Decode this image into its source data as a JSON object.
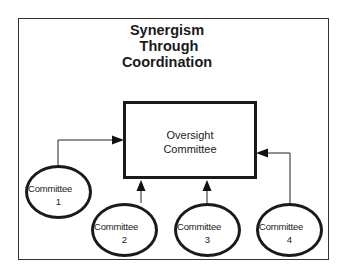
{
  "diagram": {
    "title_lines": [
      "Synergism",
      "Through",
      "Coordination"
    ],
    "center": {
      "line1": "Oversight",
      "line2": "Committee"
    },
    "committees": [
      {
        "label": "Committee",
        "number": "1"
      },
      {
        "label": "Committee",
        "number": "2"
      },
      {
        "label": "Committee",
        "number": "3"
      },
      {
        "label": "Committee",
        "number": "4"
      }
    ],
    "connections": [
      {
        "from": "Committee 1",
        "to": "Oversight Committee"
      },
      {
        "from": "Committee 2",
        "to": "Oversight Committee"
      },
      {
        "from": "Committee 3",
        "to": "Oversight Committee"
      },
      {
        "from": "Committee 4",
        "to": "Oversight Committee"
      }
    ]
  }
}
